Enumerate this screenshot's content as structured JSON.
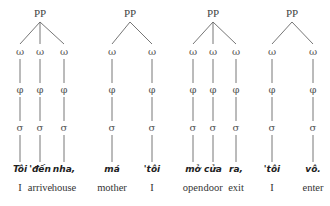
{
  "diagram": {
    "type": "prosodic-trees",
    "node_labels": {
      "root": "PP",
      "word": "ω",
      "foot": "φ",
      "syllable": "σ"
    },
    "trees": [
      {
        "root": {
          "label": "PP",
          "x": 40
        },
        "leaves": [
          {
            "x": 20,
            "word": "Tôi",
            "gloss": "I"
          },
          {
            "x": 40,
            "word": "'đến",
            "gloss": "arrive"
          },
          {
            "x": 64,
            "word": "nha,",
            "gloss": "house"
          }
        ]
      },
      {
        "root": {
          "label": "PP",
          "x": 130
        },
        "leaves": [
          {
            "x": 112,
            "word": "má",
            "gloss": "mother"
          },
          {
            "x": 152,
            "word": "'tôi",
            "gloss": "I"
          }
        ]
      },
      {
        "root": {
          "label": "PP",
          "x": 213
        },
        "leaves": [
          {
            "x": 193,
            "word": "mở",
            "gloss": "open"
          },
          {
            "x": 213,
            "word": "cửa",
            "gloss": "door"
          },
          {
            "x": 236,
            "word": "ra,",
            "gloss": "exit"
          }
        ]
      },
      {
        "root": {
          "label": "PP",
          "x": 292
        },
        "leaves": [
          {
            "x": 272,
            "word": "'tôi",
            "gloss": "I"
          },
          {
            "x": 313,
            "word": "vô.",
            "gloss": "enter"
          }
        ]
      }
    ]
  }
}
